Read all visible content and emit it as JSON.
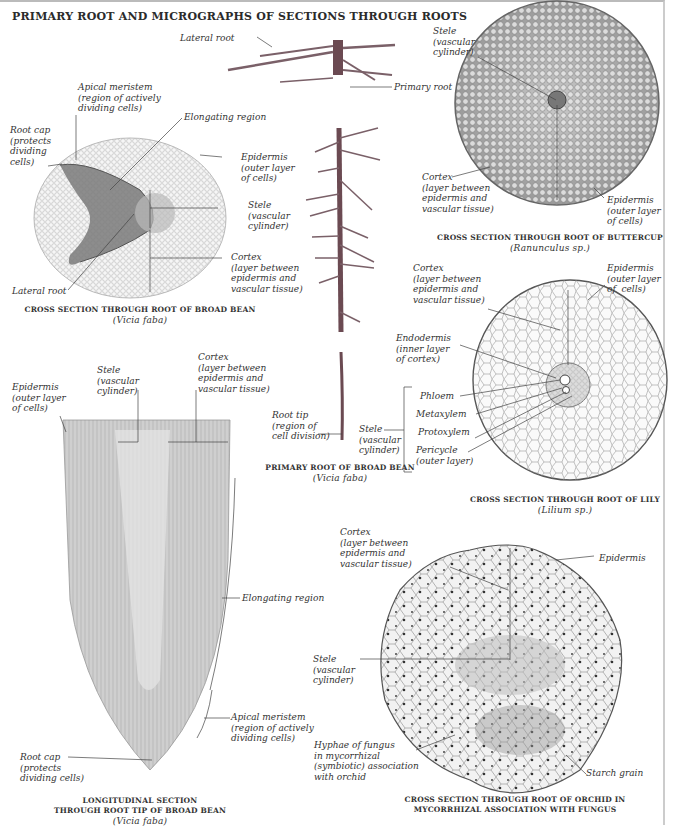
{
  "title": "PRIMARY ROOT AND MICROGRAPHS OF SECTIONS THROUGH ROOTS",
  "panels": {
    "broad_bean_cross": {
      "caption": "CROSS SECTION THROUGH ROOT OF BROAD BEAN",
      "species": "(Vicia faba)",
      "labels": {
        "apical_meristem": "Apical meristem\n(region of actively\ndividing cells)",
        "root_cap": "Root cap\n(protects\ndividing\ncells)",
        "elongating": "Elongating region",
        "epidermis": "Epidermis\n(outer layer\nof cells)",
        "stele": "Stele\n(vascular\ncylinder)",
        "cortex": "Cortex\n(layer between\nepidermis and\nvascular tissue)",
        "lateral_root": "Lateral root"
      }
    },
    "primary_root": {
      "caption": "PRIMARY ROOT OF BROAD BEAN",
      "species": "(Vicia faba)",
      "labels": {
        "lateral_root": "Lateral root",
        "primary_root": "Primary root",
        "root_tip": "Root tip\n(region of\ncell division)"
      }
    },
    "buttercup_cross": {
      "caption": "CROSS SECTION THROUGH ROOT OF BUTTERCUP",
      "species": "(Ranunculus sp.)",
      "labels": {
        "stele": "Stele\n(vascular\ncylinder)",
        "cortex": "Cortex\n(layer between\nepidermis and\nvascular tissue)",
        "epidermis": "Epidermis\n(outer layer\nof cells)"
      }
    },
    "lily_cross": {
      "caption": "CROSS SECTION THROUGH ROOT OF LILY",
      "species": "(Lilium sp.)",
      "labels": {
        "cortex": "Cortex\n(layer between\nepidermis and\nvascular tissue)",
        "epidermis": "Epidermis\n(outer layer\nof  cells)",
        "endodermis": "Endodermis\n(inner layer\nof cortex)",
        "phloem": "Phloem",
        "metaxylem": "Metaxylem",
        "protoxylem": "Protoxylem",
        "pericycle": "Pericycle\n(outer layer)",
        "stele": "Stele\n(vascular\ncylinder)"
      }
    },
    "longitudinal": {
      "caption": "LONGITUDINAL SECTION\nTHROUGH ROOT TIP OF BROAD BEAN",
      "species": "(Vicia faba)",
      "labels": {
        "stele": "Stele\n(vascular\ncylinder)",
        "cortex": "Cortex\n(layer between\nepidermis and\nvascular tissue)",
        "epidermis": "Epidermis\n(outer layer\nof cells)",
        "elongating": "Elongating region",
        "apical_meristem": "Apical meristem\n(region of actively\ndividing cells)",
        "root_cap": "Root cap\n(protects\ndividing cells)"
      }
    },
    "orchid_cross": {
      "caption": "CROSS SECTION THROUGH ROOT OF ORCHID IN\nMYCORRHIZAL ASSOCIATION WITH FUNGUS",
      "labels": {
        "cortex": "Cortex\n(layer between\nepidermis and\nvascular tissue)",
        "epidermis": "Epidermis",
        "stele": "Stele\n(vascular\ncylinder)",
        "hyphae": "Hyphae of fungus\nin mycorrhizal\n(symbiotic) association\nwith orchid",
        "starch": "Starch grain"
      }
    }
  },
  "colors": {
    "root_brown": "#6b4a52",
    "tissue_gray": "#b8b8b8",
    "cell_outline": "#888888",
    "text": "#333333"
  }
}
